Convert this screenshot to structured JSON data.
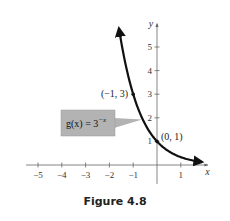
{
  "chart_data": {
    "type": "line",
    "title": "",
    "caption": "Figure 4.8",
    "xlabel": "x",
    "ylabel": "y",
    "xlim": [
      -5.5,
      2.0
    ],
    "ylim": [
      -0.8,
      5.9
    ],
    "x_ticks": [
      -5,
      -4,
      -3,
      -2,
      -1,
      1
    ],
    "x_tick_labels": [
      "−5",
      "−4",
      "−3",
      "−2",
      "−1",
      "1"
    ],
    "y_ticks": [
      1,
      2,
      3,
      4,
      5
    ],
    "y_tick_labels": [
      "1",
      "2",
      "3",
      "4",
      "5"
    ],
    "grid": false,
    "series": [
      {
        "name": "g(x) = 3^(-x)",
        "function": "3^(-x)",
        "x_range": [
          -1.6,
          1.9
        ],
        "arrows": "both",
        "color": "#111111"
      }
    ],
    "points": [
      {
        "x": -1,
        "y": 3,
        "label": "(−1, 3)"
      },
      {
        "x": 0,
        "y": 1,
        "label": "(0, 1)"
      }
    ],
    "function_label": {
      "base": "g(x) = 3",
      "exponent": "−x",
      "background": "#b3b3b3"
    }
  }
}
